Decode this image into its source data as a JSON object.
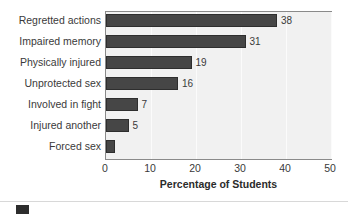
{
  "chart_data": {
    "type": "bar",
    "orientation": "horizontal",
    "title": "",
    "xlabel": "Percentage of Students",
    "ylabel": "",
    "xlim": [
      0,
      50
    ],
    "xticks": [
      0,
      10,
      20,
      30,
      40,
      50
    ],
    "xtick_labels": [
      "0",
      "10",
      "20",
      "30",
      "40",
      "50"
    ],
    "grid": true,
    "grid_axis": "x",
    "legend": false,
    "categories": [
      "Regretted actions",
      "Impaired memory",
      "Physically injured",
      "Unprotected sex",
      "Involved in fight",
      "Injured another",
      "Forced sex"
    ],
    "values": [
      38,
      31,
      19,
      16,
      7,
      5,
      2
    ],
    "data_labels": [
      "38",
      "31",
      "19",
      "16",
      "7",
      "5",
      ""
    ],
    "bar_color": "#464646",
    "plot_background": "#f1f1f1",
    "page_background": "#ffffff",
    "text_color": "#3a3a3a"
  },
  "legend_strip": {
    "swatch_color": "#2d2d2d"
  }
}
